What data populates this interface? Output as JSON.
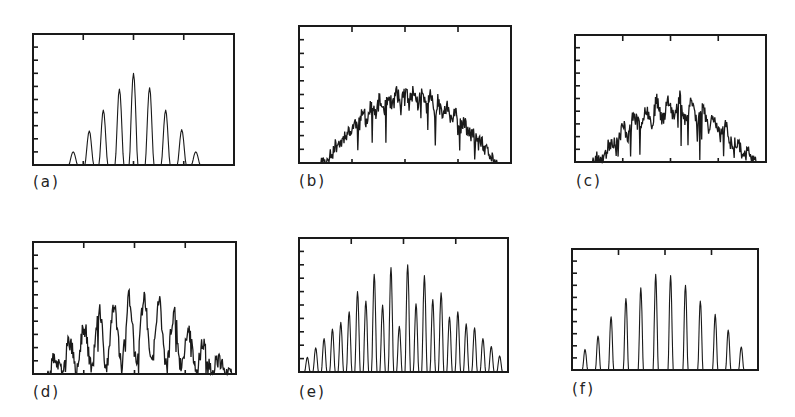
{
  "figure": {
    "panels": [
      {
        "id": "a",
        "label": "(a)",
        "box": [
          33,
          34,
          234,
          165
        ],
        "label_pos": [
          33,
          173
        ]
      },
      {
        "id": "b",
        "label": "(b)",
        "box": [
          299,
          26,
          511,
          163
        ],
        "label_pos": [
          299,
          172
        ]
      },
      {
        "id": "c",
        "label": "(c)",
        "box": [
          575,
          35,
          766,
          162
        ],
        "label_pos": [
          576,
          172
        ]
      },
      {
        "id": "d",
        "label": "(d)",
        "box": [
          33,
          242,
          236,
          374
        ],
        "label_pos": [
          33,
          383
        ]
      },
      {
        "id": "e",
        "label": "(e)",
        "box": [
          299,
          238,
          508,
          372
        ],
        "label_pos": [
          299,
          383
        ]
      },
      {
        "id": "f",
        "label": "(f)",
        "box": [
          572,
          249,
          758,
          370
        ],
        "label_pos": [
          572,
          380
        ]
      }
    ],
    "ink_color": "#1a1a1a",
    "background": "#ffffff"
  },
  "chart_data": [
    {
      "panel": "(a)",
      "type": "line",
      "title": "",
      "xlabel": "",
      "ylabel": "",
      "xlim": [
        0,
        1
      ],
      "ylim": [
        0,
        10
      ],
      "y_ticks": 9,
      "x_ticks_top": [
        0.25,
        0.5,
        0.75
      ],
      "x_ticks_bottom": [
        0.25,
        0.5,
        0.75
      ],
      "grid": false,
      "style": "discrete_peaks",
      "peaks": {
        "x": [
          0.2,
          0.28,
          0.35,
          0.43,
          0.5,
          0.58,
          0.66,
          0.74,
          0.81
        ],
        "y": [
          1.0,
          2.6,
          4.2,
          5.8,
          7.0,
          5.9,
          4.2,
          2.7,
          1.0
        ],
        "halfwidth": 0.022
      }
    },
    {
      "panel": "(b)",
      "type": "line",
      "title": "",
      "xlabel": "",
      "ylabel": "",
      "xlim": [
        0,
        1
      ],
      "ylim": [
        0,
        10
      ],
      "y_ticks": 9,
      "x_ticks_top": [
        0.25,
        0.5,
        0.75
      ],
      "x_ticks_bottom": [
        0.25,
        0.5,
        0.75
      ],
      "grid": false,
      "style": "noisy_envelope",
      "envelope": {
        "center": 0.52,
        "halfwidth": 0.42,
        "peak": 5.4,
        "noise": 1.2,
        "fringe_period": 0.04,
        "fringe_depth": 0.15
      },
      "seed": 11
    },
    {
      "panel": "(c)",
      "type": "line",
      "title": "",
      "xlabel": "",
      "ylabel": "",
      "xlim": [
        0,
        1
      ],
      "ylim": [
        0,
        10
      ],
      "y_ticks": 9,
      "x_ticks_top": [
        0.25,
        0.5,
        0.75
      ],
      "x_ticks_bottom": [
        0.25,
        0.5,
        0.75
      ],
      "grid": false,
      "style": "noisy_envelope",
      "envelope": {
        "center": 0.52,
        "halfwidth": 0.43,
        "peak": 5.3,
        "noise": 1.3,
        "fringe_period": 0.06,
        "fringe_depth": 0.3
      },
      "seed": 23
    },
    {
      "panel": "(d)",
      "type": "line",
      "title": "",
      "xlabel": "",
      "ylabel": "",
      "xlim": [
        0,
        1
      ],
      "ylim": [
        0,
        10
      ],
      "y_ticks": 9,
      "x_ticks_top": [
        0.25,
        0.5,
        0.75
      ],
      "x_ticks_bottom": [
        0.25,
        0.5,
        0.75
      ],
      "grid": false,
      "style": "noisy_envelope",
      "envelope": {
        "center": 0.51,
        "halfwidth": 0.47,
        "peak": 6.0,
        "noise": 1.4,
        "fringe_period": 0.074,
        "fringe_depth": 0.85
      },
      "seed": 37
    },
    {
      "panel": "(e)",
      "type": "line",
      "title": "",
      "xlabel": "",
      "ylabel": "",
      "xlim": [
        0,
        1
      ],
      "ylim": [
        0,
        10
      ],
      "y_ticks": 9,
      "x_ticks_top": [
        0.25,
        0.5,
        0.75
      ],
      "x_ticks_bottom": [],
      "grid": false,
      "style": "discrete_peaks",
      "peaks": {
        "x": [
          0.04,
          0.08,
          0.12,
          0.16,
          0.2,
          0.24,
          0.28,
          0.32,
          0.36,
          0.4,
          0.44,
          0.48,
          0.52,
          0.56,
          0.6,
          0.64,
          0.68,
          0.72,
          0.76,
          0.8,
          0.84,
          0.88,
          0.92,
          0.96
        ],
        "y": [
          1.1,
          1.8,
          2.5,
          3.2,
          3.7,
          4.5,
          6.0,
          5.3,
          7.3,
          5.0,
          7.8,
          3.4,
          8.0,
          5.1,
          7.2,
          5.4,
          5.9,
          4.1,
          4.5,
          3.6,
          3.3,
          2.5,
          1.9,
          1.2
        ],
        "halfwidth": 0.013
      }
    },
    {
      "panel": "(f)",
      "type": "line",
      "title": "",
      "xlabel": "",
      "ylabel": "",
      "xlim": [
        0,
        1
      ],
      "ylim": [
        0,
        10
      ],
      "y_ticks": 9,
      "x_ticks_top": [
        0.25,
        0.5,
        0.75
      ],
      "x_ticks_bottom": [],
      "grid": false,
      "style": "discrete_peaks",
      "peaks": {
        "x": [
          0.07,
          0.14,
          0.21,
          0.29,
          0.37,
          0.45,
          0.53,
          0.61,
          0.69,
          0.77,
          0.84,
          0.91
        ],
        "y": [
          1.7,
          2.8,
          4.4,
          5.9,
          6.8,
          7.9,
          7.8,
          7.0,
          5.7,
          4.6,
          3.3,
          1.9
        ],
        "halfwidth": 0.014
      }
    }
  ]
}
